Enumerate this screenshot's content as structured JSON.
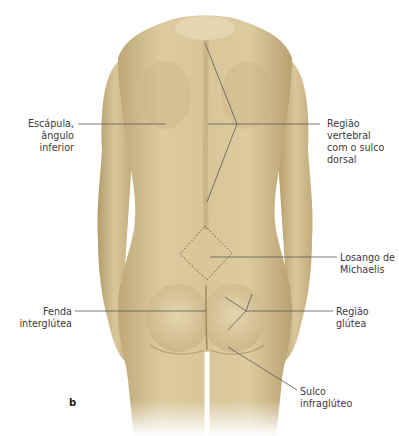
{
  "figure": {
    "panel_letter": "b",
    "view": "posterior view of female body (back)",
    "colors": {
      "skin_light": "#e4d6b0",
      "skin_mid": "#cdb98a",
      "skin_shadow": "#a8915e",
      "leader_line": "#5a5a5a",
      "background": "#ffffff"
    },
    "labels": {
      "escapula": {
        "lines": [
          "Escápula,",
          "ângulo",
          "inferior"
        ]
      },
      "vertebral": {
        "lines": [
          "Região",
          "vertebral",
          "com o sulco",
          "dorsal"
        ]
      },
      "losango": {
        "lines": [
          "Losango de",
          "Michaelis"
        ]
      },
      "fenda": {
        "lines": [
          "Fenda",
          "interglútea"
        ]
      },
      "glutea": {
        "lines": [
          "Região",
          "glútea"
        ]
      },
      "sulco": {
        "lines": [
          "Sulco",
          "infraglúteo"
        ]
      }
    }
  }
}
